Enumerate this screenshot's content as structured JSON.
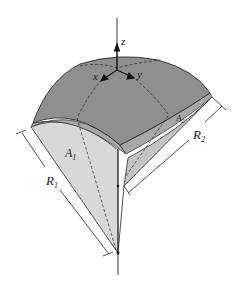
{
  "figure": {
    "labels": {
      "z": "z",
      "x": "x",
      "y": "y",
      "A1": "A",
      "A1_sub": "1",
      "A2": "A",
      "A2_sub": "2",
      "R1": "R",
      "R1_sub": "1",
      "R2": "R",
      "R2_sub": "2"
    },
    "colors": {
      "top_surface": "#8f8f8f",
      "rim": "#a9a9a9",
      "left_face": "#d6d6d6",
      "right_face": "#c2c2c2",
      "stroke": "#2a2a2a"
    }
  }
}
